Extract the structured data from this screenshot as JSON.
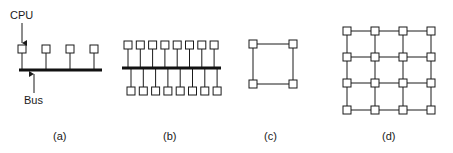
{
  "diagram": {
    "panels": [
      {
        "id": "a",
        "caption": "(a)",
        "type": "single-bus",
        "nodes": 4
      },
      {
        "id": "b",
        "caption": "(b)",
        "type": "double-sided-bus",
        "nodes": 16
      },
      {
        "id": "c",
        "caption": "(c)",
        "type": "ring-square",
        "nodes": 4
      },
      {
        "id": "d",
        "caption": "(d)",
        "type": "mesh-grid",
        "rows": 4,
        "cols": 4
      }
    ],
    "labels": {
      "cpu": "CPU",
      "bus": "Bus"
    },
    "colors": {
      "line": "#1a1a1a",
      "background": "#ffffff"
    }
  }
}
